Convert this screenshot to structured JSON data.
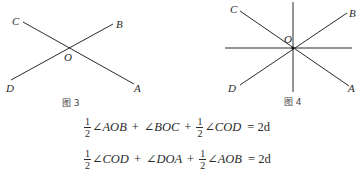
{
  "figures": [
    {
      "id": "fig3",
      "caption": "图 3",
      "center_label": "O",
      "labels": {
        "A": "A",
        "B": "B",
        "C": "C",
        "D": "D"
      }
    },
    {
      "id": "fig4",
      "caption": "图 4",
      "center_label": "O",
      "labels": {
        "A": "A",
        "B": "B",
        "C": "C",
        "D": "D"
      }
    }
  ],
  "equations": [
    {
      "terms": [
        {
          "coef_num": "1",
          "coef_den": "2",
          "angle": "∠AOB"
        },
        {
          "op": "+"
        },
        {
          "angle": "∠BOC"
        },
        {
          "op": "+"
        },
        {
          "coef_num": "1",
          "coef_den": "2",
          "angle": "∠COD"
        }
      ],
      "rhs": "= 2d"
    },
    {
      "terms": [
        {
          "coef_num": "1",
          "coef_den": "2",
          "angle": "∠COD"
        },
        {
          "op": "+"
        },
        {
          "angle": "∠DOA"
        },
        {
          "op": "+"
        },
        {
          "coef_num": "1",
          "coef_den": "2",
          "angle": "∠AOB"
        }
      ],
      "rhs": "= 2d"
    }
  ],
  "colors": {
    "line": "#2a2a2a",
    "text": "#2a2a2a"
  }
}
